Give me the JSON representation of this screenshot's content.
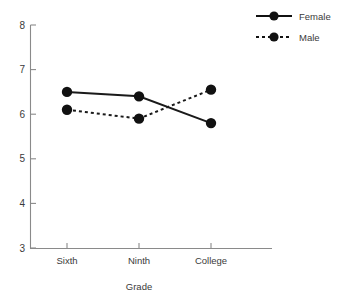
{
  "chart_data": {
    "type": "line",
    "title": "",
    "xlabel": "Grade",
    "ylabel": "",
    "categories": [
      "Sixth",
      "Ninth",
      "College"
    ],
    "series": [
      {
        "name": "Female",
        "values": [
          6.5,
          6.4,
          5.8
        ],
        "style": "solid",
        "marker": "filled-circle",
        "color": "#111111"
      },
      {
        "name": "Male",
        "values": [
          6.1,
          5.9,
          6.55
        ],
        "style": "dotted",
        "marker": "filled-circle",
        "color": "#111111"
      }
    ],
    "ylim": [
      3,
      8
    ],
    "yticks": [
      "3",
      "4",
      "5",
      "6",
      "7",
      "8"
    ],
    "grid": false,
    "legend_position": "top-right"
  },
  "axes": {
    "y_tick_labels": [
      "8",
      "7",
      "6",
      "5",
      "4",
      "3"
    ],
    "x_tick_labels": [
      "Sixth",
      "Ninth",
      "College"
    ],
    "x_axis_title": "Grade"
  },
  "legend": {
    "entries": [
      {
        "label": "Female",
        "style": "solid"
      },
      {
        "label": "Male",
        "style": "dotted"
      }
    ]
  },
  "colors": {
    "ink": "#111111",
    "axis": "#8a8a8a",
    "text": "#3a3a3a",
    "background": "#ffffff"
  }
}
